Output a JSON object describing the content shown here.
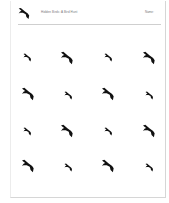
{
  "header": {
    "logo_icon": "bird-icon",
    "title": "Hidden Birds: A Bird Hunt",
    "right_label": "Name:"
  },
  "grid": {
    "rows": 4,
    "columns": 4,
    "icon": "bird-silhouette-icon",
    "color": "#111111",
    "cells": [
      {
        "row": 1,
        "col": 1,
        "size": "small"
      },
      {
        "row": 1,
        "col": 2,
        "size": "large"
      },
      {
        "row": 1,
        "col": 3,
        "size": "small"
      },
      {
        "row": 1,
        "col": 4,
        "size": "large"
      },
      {
        "row": 2,
        "col": 1,
        "size": "large"
      },
      {
        "row": 2,
        "col": 2,
        "size": "small"
      },
      {
        "row": 2,
        "col": 3,
        "size": "large"
      },
      {
        "row": 2,
        "col": 4,
        "size": "small"
      },
      {
        "row": 3,
        "col": 1,
        "size": "small"
      },
      {
        "row": 3,
        "col": 2,
        "size": "large"
      },
      {
        "row": 3,
        "col": 3,
        "size": "small"
      },
      {
        "row": 3,
        "col": 4,
        "size": "large"
      },
      {
        "row": 4,
        "col": 1,
        "size": "large"
      },
      {
        "row": 4,
        "col": 2,
        "size": "small"
      },
      {
        "row": 4,
        "col": 3,
        "size": "large"
      },
      {
        "row": 4,
        "col": 4,
        "size": "small"
      }
    ]
  }
}
